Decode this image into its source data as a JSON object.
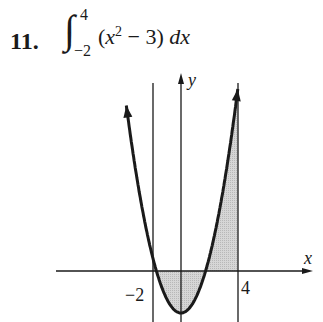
{
  "problem": {
    "number": "11.",
    "integral_sign": "∫",
    "upper_limit": "4",
    "lower_limit": "−2",
    "integrand_prefix": "(",
    "integrand_var": "x",
    "integrand_exp": "2",
    "integrand_suffix": " − 3) ",
    "differential": "dx"
  },
  "graph": {
    "x_axis_label": "x",
    "y_axis_label": "y",
    "tick_left": "−2",
    "tick_right": "4",
    "curve_color": "#1a1a1a",
    "shade_color": "#cfcfcf"
  },
  "chart_data": {
    "type": "area",
    "function": "y = x^2 - 3",
    "xlabel": "x",
    "ylabel": "y",
    "x_ticks": [
      -2,
      4
    ],
    "shaded_interval": [
      -2,
      4
    ],
    "vertical_lines_at": [
      -2,
      4
    ],
    "vertex": [
      0,
      -3
    ],
    "roots": [
      -1.732,
      1.732
    ],
    "xlim": [
      -4,
      8.5
    ],
    "ylim": [
      -3.5,
      14
    ],
    "grid": false,
    "legend": "none",
    "sample_points": {
      "x": [
        -2,
        -1,
        0,
        1,
        2,
        3,
        4
      ],
      "y": [
        1,
        -2,
        -3,
        -2,
        1,
        6,
        13
      ]
    }
  }
}
